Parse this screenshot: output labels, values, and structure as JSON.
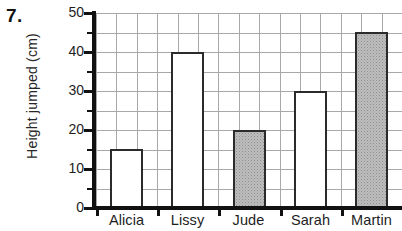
{
  "question_number": "7.",
  "chart_data": {
    "type": "bar",
    "title": "",
    "xlabel": "",
    "ylabel": "Height jumped  (cm)",
    "categories": [
      "Alicia",
      "Lissy",
      "Jude",
      "Sarah",
      "Martin"
    ],
    "values": [
      15,
      40,
      20,
      30,
      45
    ],
    "bar_fills": [
      "white",
      "white",
      "gray",
      "white",
      "gray"
    ],
    "ylim": [
      0,
      50
    ],
    "ytick_labels": [
      "0",
      "10",
      "20",
      "30",
      "40",
      "50"
    ],
    "ytick_values": [
      0,
      10,
      20,
      30,
      40,
      50
    ],
    "yminor_tick_values": [
      5,
      15,
      25,
      35,
      45
    ],
    "grid": true,
    "grid_color": "#a8a8a8",
    "legend": "none",
    "axis_color": "#111111",
    "bar_edge_color": "#2b2b2b",
    "bar_gray_color": "#bdbdbd",
    "background": "#ffffff"
  }
}
